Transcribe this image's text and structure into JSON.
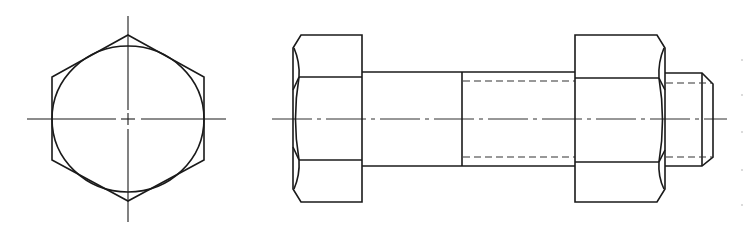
{
  "drawing": {
    "title": "Hex bolt and nut assembly — end view and side view",
    "colors": {
      "line": "#1a1a1a",
      "background": "#ffffff"
    },
    "views": [
      {
        "name": "end-view",
        "description": "Hexagon with inscribed circle and centerlines"
      },
      {
        "name": "side-view",
        "description": "Bolt head, shank, threaded section, hex nut and chamfered thread end with axis centerline"
      }
    ]
  }
}
